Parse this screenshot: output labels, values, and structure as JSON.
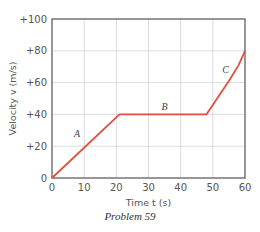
{
  "caption": "Problem 59",
  "chart_data": {
    "type": "line",
    "title": "",
    "xlabel": "Time  t  (s)",
    "ylabel": "Velocity  v  (m/s)",
    "xlim": [
      0,
      60
    ],
    "ylim": [
      0,
      100
    ],
    "xticks": [
      0,
      10,
      20,
      30,
      40,
      50,
      60
    ],
    "xtick_labels": [
      "0",
      "10",
      "20",
      "30",
      "40",
      "50",
      "60"
    ],
    "yticks": [
      0,
      20,
      40,
      60,
      80,
      100
    ],
    "ytick_labels": [
      "0",
      "+20",
      "+40",
      "+60",
      "+80",
      "+100"
    ],
    "grid": true,
    "legend": null,
    "line_color": "#e0503c",
    "series": [
      {
        "name": "velocity",
        "x": [
          0,
          21,
          48,
          50,
          52,
          55,
          58,
          60
        ],
        "y": [
          0,
          40,
          40,
          46,
          52,
          61,
          71,
          80
        ]
      }
    ],
    "annotations": [
      {
        "text": "A",
        "x": 7.8,
        "y": 26
      },
      {
        "text": "B",
        "x": 35,
        "y": 43
      },
      {
        "text": "C",
        "x": 54,
        "y": 66
      }
    ]
  }
}
